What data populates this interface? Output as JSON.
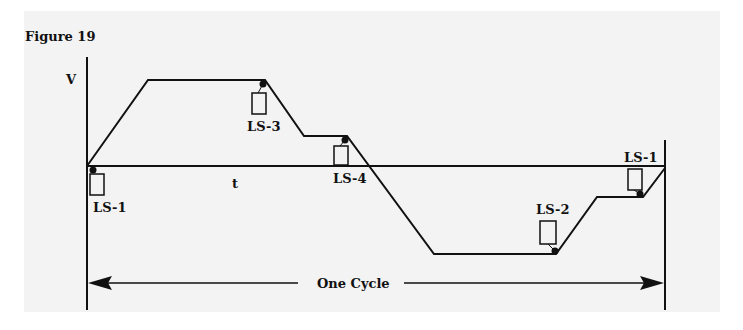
{
  "figure": {
    "title": "Figure 19",
    "axis_labels": {
      "y": "V",
      "x": "t"
    },
    "limit_switches": [
      {
        "id": "ls1-start",
        "label": "LS-1"
      },
      {
        "id": "ls3",
        "label": "LS-3"
      },
      {
        "id": "ls4",
        "label": "LS-4"
      },
      {
        "id": "ls2",
        "label": "LS-2"
      },
      {
        "id": "ls1-end",
        "label": "LS-1"
      }
    ],
    "cycle_label": "One Cycle",
    "colors": {
      "background": "#f3f3f3",
      "ink": "#111111"
    }
  }
}
